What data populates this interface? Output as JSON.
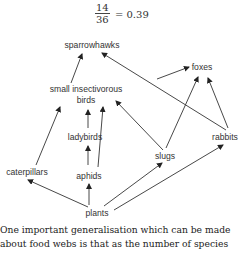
{
  "formula": {
    "numerator": "14",
    "denominator": "36",
    "result": "= 0.39"
  },
  "food_web": {
    "nodes": [
      {
        "id": "sparrowhawks",
        "label": "sparrowhawks"
      },
      {
        "id": "birds_line1",
        "label": "small insectivorous"
      },
      {
        "id": "birds_line2",
        "label": "birds"
      },
      {
        "id": "foxes",
        "label": "foxes"
      },
      {
        "id": "ladybirds",
        "label": "ladybirds"
      },
      {
        "id": "rabbits",
        "label": "rabbits"
      },
      {
        "id": "caterpillars",
        "label": "caterpillars"
      },
      {
        "id": "aphids",
        "label": "aphids"
      },
      {
        "id": "slugs",
        "label": "slugs"
      },
      {
        "id": "plants",
        "label": "plants"
      }
    ],
    "edges": [
      [
        "small insectivorous birds",
        "sparrowhawks"
      ],
      [
        "rabbits",
        "sparrowhawks"
      ],
      [
        "small insectivorous birds",
        "foxes"
      ],
      [
        "slugs",
        "foxes"
      ],
      [
        "rabbits",
        "foxes"
      ],
      [
        "caterpillars",
        "small insectivorous birds"
      ],
      [
        "ladybirds",
        "small insectivorous birds"
      ],
      [
        "aphids",
        "small insectivorous birds"
      ],
      [
        "slugs",
        "small insectivorous birds"
      ],
      [
        "aphids",
        "ladybirds"
      ],
      [
        "plants",
        "caterpillars"
      ],
      [
        "plants",
        "aphids"
      ],
      [
        "plants",
        "slugs"
      ],
      [
        "plants",
        "rabbits"
      ]
    ]
  },
  "body": {
    "line1": "One important generalisation which can be made",
    "line2": "about food webs is that as the number of species"
  }
}
